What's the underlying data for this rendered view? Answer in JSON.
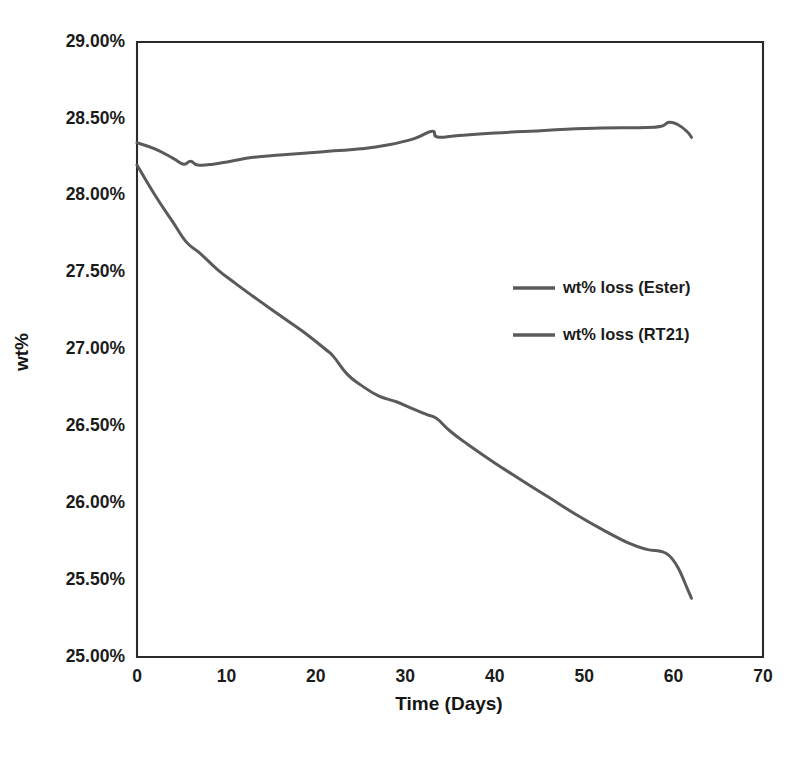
{
  "chart_data": {
    "type": "line",
    "title": "",
    "xlabel": "Time (Days)",
    "ylabel": "wt%",
    "xlim": [
      0,
      70
    ],
    "ylim": [
      25.0,
      29.0
    ],
    "grid": false,
    "legend_position": "center-right",
    "x_ticks": [
      "0",
      "10",
      "20",
      "30",
      "40",
      "50",
      "60",
      "70"
    ],
    "x_tick_values": [
      0,
      10,
      20,
      30,
      40,
      50,
      60,
      70
    ],
    "y_ticks": [
      "25.00%",
      "25.50%",
      "26.00%",
      "26.50%",
      "27.00%",
      "27.50%",
      "28.00%",
      "28.50%",
      "29.00%"
    ],
    "y_tick_values": [
      25.0,
      25.5,
      26.0,
      26.5,
      27.0,
      27.5,
      28.0,
      28.5,
      29.0
    ],
    "series": [
      {
        "name": "wt% loss (Ester)",
        "color": "#5a5a5a",
        "width": 3.0,
        "x": [
          0,
          2,
          4,
          5.2,
          6.0,
          6.8,
          8.5,
          10.5,
          13,
          16,
          19,
          22,
          25,
          28,
          31,
          33,
          33.6,
          36,
          40,
          44,
          48,
          52,
          56,
          58.5,
          59.5,
          60.5,
          61.5,
          62
        ],
        "y": [
          28.345,
          28.305,
          28.245,
          28.205,
          28.225,
          28.2,
          28.205,
          28.225,
          28.25,
          28.265,
          28.278,
          28.292,
          28.305,
          28.33,
          28.372,
          28.42,
          28.382,
          28.392,
          28.408,
          28.42,
          28.432,
          28.44,
          28.443,
          28.45,
          28.478,
          28.462,
          28.418,
          28.38
        ]
      },
      {
        "name": "wt% loss (RT21)",
        "color": "#5a5a5a",
        "width": 3.0,
        "x": [
          0,
          2,
          4,
          5.5,
          7,
          9,
          11,
          13,
          15,
          17,
          19,
          21,
          22,
          23.5,
          25,
          27,
          29,
          31,
          32.5,
          33.5,
          35,
          37,
          40,
          43,
          46,
          49,
          52,
          55,
          57,
          58.5,
          59.5,
          60.5,
          61.5,
          62
        ],
        "y": [
          28.2,
          28.005,
          27.83,
          27.7,
          27.628,
          27.52,
          27.43,
          27.345,
          27.262,
          27.18,
          27.098,
          27.005,
          26.952,
          26.84,
          26.77,
          26.698,
          26.66,
          26.61,
          26.575,
          26.552,
          26.47,
          26.382,
          26.262,
          26.15,
          26.04,
          25.93,
          25.83,
          25.74,
          25.7,
          25.688,
          25.66,
          25.58,
          25.45,
          25.382
        ]
      }
    ],
    "legend_entries": [
      {
        "label": "wt% loss (Ester)",
        "color": "#5a5a5a"
      },
      {
        "label": "wt% loss (RT21)",
        "color": "#5a5a5a"
      }
    ]
  }
}
